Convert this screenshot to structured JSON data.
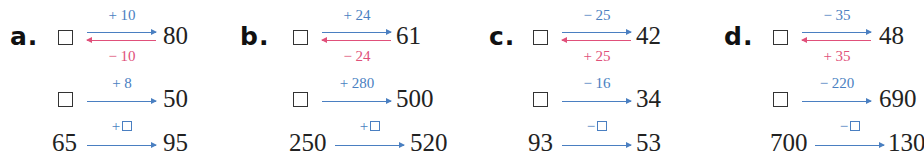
{
  "colors": {
    "forward_arrow": "#4a7fc1",
    "inverse_arrow": "#e0507a",
    "text": "#222222"
  },
  "problems": [
    {
      "letter": "a.",
      "rows": [
        {
          "start": "",
          "start_is_box": true,
          "op_forward": "+ 10",
          "op_inverse": "− 10",
          "end": "80"
        },
        {
          "start": "",
          "start_is_box": true,
          "op_forward": "+ 8",
          "end": "50"
        },
        {
          "start": "65",
          "start_is_box": false,
          "op_forward": "+",
          "op_has_box": true,
          "end": "95"
        }
      ]
    },
    {
      "letter": "b.",
      "rows": [
        {
          "start": "",
          "start_is_box": true,
          "op_forward": "+ 24",
          "op_inverse": "− 24",
          "end": "61"
        },
        {
          "start": "",
          "start_is_box": true,
          "op_forward": "+ 280",
          "end": "500"
        },
        {
          "start": "250",
          "start_is_box": false,
          "op_forward": "+",
          "op_has_box": true,
          "end": "520"
        }
      ]
    },
    {
      "letter": "c.",
      "rows": [
        {
          "start": "",
          "start_is_box": true,
          "op_forward": "− 25",
          "op_inverse": "+ 25",
          "end": "42"
        },
        {
          "start": "",
          "start_is_box": true,
          "op_forward": "− 16",
          "end": "34"
        },
        {
          "start": "93",
          "start_is_box": false,
          "op_forward": "−",
          "op_has_box": true,
          "end": "53"
        }
      ]
    },
    {
      "letter": "d.",
      "rows": [
        {
          "start": "",
          "start_is_box": true,
          "op_forward": "− 35",
          "op_inverse": "+ 35",
          "end": "48"
        },
        {
          "start": "",
          "start_is_box": true,
          "op_forward": "− 220",
          "end": "690"
        },
        {
          "start": "700",
          "start_is_box": false,
          "op_forward": "−",
          "op_has_box": true,
          "end": "130"
        }
      ]
    }
  ]
}
